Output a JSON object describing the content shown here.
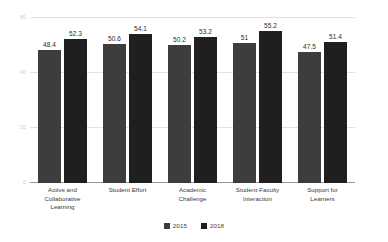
{
  "chart_data": {
    "type": "bar",
    "title": "",
    "subtitle": "",
    "xlabel": "",
    "ylabel": "",
    "ylim": [
      0,
      60
    ],
    "yticks": [
      0,
      20,
      40,
      60
    ],
    "ytick_labels": [
      "0",
      "20",
      "40",
      "60"
    ],
    "grid": true,
    "legend_position": "bottom",
    "categories": [
      "Active and Collaborative Learning",
      "Student Effort",
      "Academic Challenge",
      "Student-Faculty Interaction",
      "Support for Learners"
    ],
    "category_lines": [
      [
        "Active and",
        "Collaborative",
        "Learning"
      ],
      [
        "Student Effort"
      ],
      [
        "Academic",
        "Challenge"
      ],
      [
        "Student-Faculty",
        "Interaction"
      ],
      [
        "Support for",
        "Learners"
      ]
    ],
    "series": [
      {
        "name": "2015",
        "color": "#3d3d3d",
        "values": [
          48.4,
          50.6,
          50.2,
          51,
          47.5
        ],
        "labels": [
          "48.4",
          "50.6",
          "50.2",
          "51",
          "47.5"
        ]
      },
      {
        "name": "2018",
        "color": "#1f1f1f",
        "values": [
          52.3,
          54.1,
          53.2,
          55.2,
          51.4
        ],
        "labels": [
          "52.3",
          "54.1",
          "53.2",
          "55.2",
          "51.4"
        ]
      }
    ]
  },
  "legend": {
    "items": [
      {
        "label": "2015",
        "color": "#3d3d3d"
      },
      {
        "label": "2018",
        "color": "#1f1f1f"
      }
    ]
  },
  "colors": {
    "series_2015": "#3d3d3d",
    "series_2018": "#1f1f1f",
    "gridline": "#e2e2e2",
    "axis": "#9a9a9a",
    "tick_text": "#c9c9c9",
    "label_text": "#3a3a3a",
    "background": "#ffffff"
  }
}
